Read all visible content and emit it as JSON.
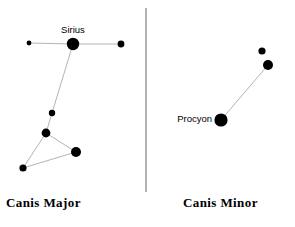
{
  "figure": {
    "background_color": "#ffffff",
    "star_color": "#000000",
    "line_color": "#b4b4b4",
    "divider_color": "#808080",
    "width": 295,
    "height": 227
  },
  "divider": {
    "x": 146,
    "y1": 8,
    "y2": 192
  },
  "panels": [
    {
      "id": "canis-major",
      "caption": "Canis Major",
      "stars": [
        {
          "name": "sirius",
          "label": "Sirius",
          "x": 73,
          "y": 44,
          "r": 6.2,
          "label_x": 73,
          "label_y": 33,
          "label_anchor": "middle"
        },
        {
          "name": "star-west",
          "label": "",
          "x": 29,
          "y": 43,
          "r": 2.4
        },
        {
          "name": "star-east",
          "label": "",
          "x": 121,
          "y": 44,
          "r": 3.4
        },
        {
          "name": "star-mid",
          "label": "",
          "x": 52,
          "y": 113,
          "r": 3.2
        },
        {
          "name": "star-junction",
          "label": "",
          "x": 46,
          "y": 133,
          "r": 4.4
        },
        {
          "name": "star-southeast",
          "label": "",
          "x": 76,
          "y": 152,
          "r": 5.0
        },
        {
          "name": "star-southwest",
          "label": "",
          "x": 23,
          "y": 168,
          "r": 3.6
        }
      ],
      "lines": [
        {
          "from": "star-west",
          "to": "sirius"
        },
        {
          "from": "sirius",
          "to": "star-east"
        },
        {
          "from": "sirius",
          "to": "star-mid"
        },
        {
          "from": "star-mid",
          "to": "star-junction"
        },
        {
          "from": "star-junction",
          "to": "star-southeast"
        },
        {
          "from": "star-junction",
          "to": "star-southwest"
        },
        {
          "from": "star-southwest",
          "to": "star-southeast"
        }
      ]
    },
    {
      "id": "canis-minor",
      "caption": "Canis Minor",
      "stars": [
        {
          "name": "procyon",
          "label": "Procyon",
          "x": 221,
          "y": 120,
          "r": 6.6,
          "label_x": 212,
          "label_y": 122,
          "label_anchor": "end"
        },
        {
          "name": "gomeisa",
          "label": "",
          "x": 268,
          "y": 65,
          "r": 5.0
        },
        {
          "name": "star-upper",
          "label": "",
          "x": 262,
          "y": 51,
          "r": 3.6
        }
      ],
      "lines": [
        {
          "from": "procyon",
          "to": "gomeisa"
        }
      ]
    }
  ]
}
